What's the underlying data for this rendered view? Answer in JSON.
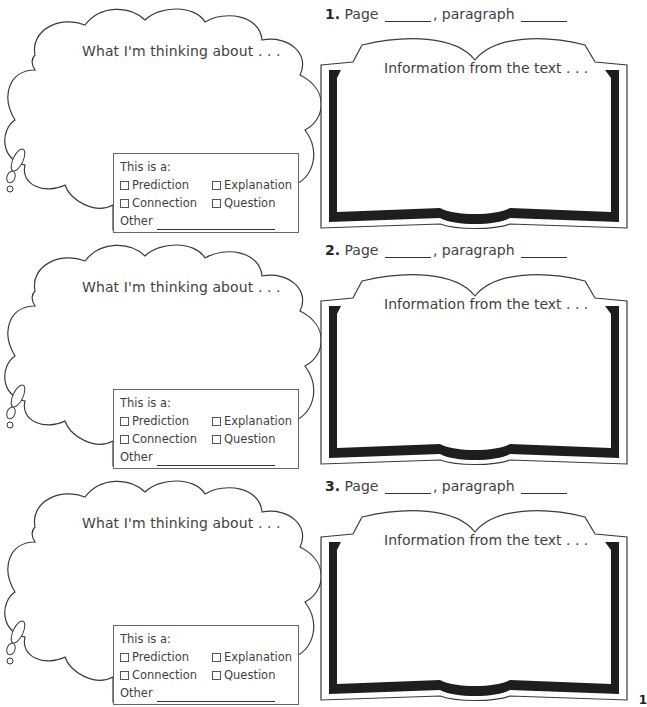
{
  "worksheet": {
    "entries": [
      {
        "number": "1.",
        "page_label": "Page",
        "paragraph_label": ", paragraph",
        "book_prompt": "Information from the text . . .",
        "cloud_prompt": "What I'm thinking about . . .",
        "type_box": {
          "heading": "This is a:",
          "options": [
            "Prediction",
            "Explanation",
            "Connection",
            "Question"
          ],
          "other_label": "Other"
        }
      },
      {
        "number": "2.",
        "page_label": "Page",
        "paragraph_label": ", paragraph",
        "book_prompt": "Information from the text . . .",
        "cloud_prompt": "What I'm thinking about . . .",
        "type_box": {
          "heading": "This is a:",
          "options": [
            "Prediction",
            "Explanation",
            "Connection",
            "Question"
          ],
          "other_label": "Other"
        }
      },
      {
        "number": "3.",
        "page_label": "Page",
        "paragraph_label": ", paragraph",
        "book_prompt": "Information from the text . . .",
        "cloud_prompt": "What I'm thinking about . . .",
        "type_box": {
          "heading": "This is a:",
          "options": [
            "Prediction",
            "Explanation",
            "Connection",
            "Question"
          ],
          "other_label": "Other"
        }
      }
    ],
    "page_number": "1"
  }
}
